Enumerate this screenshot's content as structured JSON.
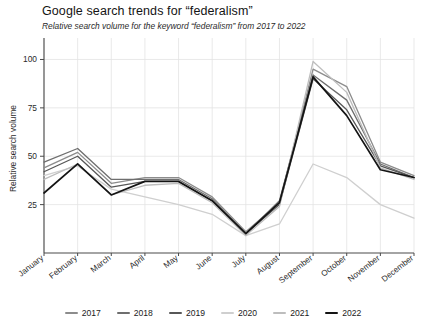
{
  "chart_data": {
    "type": "line",
    "title": "Google search trends for “federalism”",
    "subtitle": "Relative search volume for the keyword “federalism” from 2017 to 2022",
    "xlabel": "",
    "ylabel": "Relative search volume",
    "categories": [
      "January",
      "February",
      "March",
      "April",
      "May",
      "June",
      "July",
      "August",
      "September",
      "October",
      "November",
      "December"
    ],
    "yticks": [
      25,
      50,
      75,
      100
    ],
    "ylim": [
      0,
      108
    ],
    "grid": true,
    "legend_position": "bottom",
    "series": [
      {
        "name": "2017",
        "color": "#8c8c8c",
        "values": [
          44,
          52,
          36,
          39,
          39,
          29,
          11,
          26,
          95,
          86,
          47,
          40
        ]
      },
      {
        "name": "2018",
        "color": "#6e6e6e",
        "values": [
          47,
          54,
          38,
          38,
          38,
          28,
          10,
          27,
          92,
          79,
          46,
          39
        ]
      },
      {
        "name": "2019",
        "color": "#575757",
        "values": [
          42,
          50,
          34,
          37,
          37,
          27,
          10,
          25,
          90,
          74,
          45,
          39
        ]
      },
      {
        "name": "2020",
        "color": "#cfcfcf",
        "values": [
          40,
          45,
          33,
          29,
          25,
          20,
          9,
          15,
          46,
          39,
          25,
          18
        ]
      },
      {
        "name": "2021",
        "color": "#bdbdbd",
        "values": [
          38,
          46,
          30,
          35,
          36,
          26,
          9,
          24,
          99,
          83,
          44,
          38
        ]
      },
      {
        "name": "2022",
        "color": "#141414",
        "values": [
          31,
          46,
          30,
          37,
          37,
          27,
          10,
          26,
          91,
          71,
          43,
          39
        ]
      }
    ]
  },
  "legend": {
    "items": [
      {
        "label": "2017",
        "color": "#8c8c8c"
      },
      {
        "label": "2018",
        "color": "#6e6e6e"
      },
      {
        "label": "2019",
        "color": "#575757"
      },
      {
        "label": "2020",
        "color": "#cfcfcf"
      },
      {
        "label": "2021",
        "color": "#bdbdbd"
      },
      {
        "label": "2022",
        "color": "#141414"
      }
    ]
  },
  "axes": {
    "y_title": "Relative search volume",
    "y_tick_labels": [
      "100",
      "75",
      "50",
      "25"
    ],
    "x_tick_labels": [
      "January",
      "February",
      "March",
      "April",
      "May",
      "June",
      "July",
      "August",
      "September",
      "October",
      "November",
      "December"
    ]
  },
  "style": {
    "grid_color": "#e3e3e3",
    "axis_color": "#4a4a4a",
    "background": "#ffffff"
  }
}
